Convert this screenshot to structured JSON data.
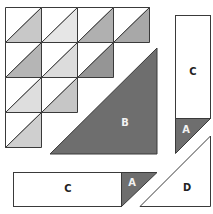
{
  "diagram": {
    "colors": {
      "outline": "#3a3a3a",
      "background": "#ffffff",
      "dark_piece": "#6e6e6e",
      "white_piece": "#ffffff"
    },
    "grid": {
      "rows": 4,
      "cols": 4,
      "shade_rows": [
        [
          "#c8c8c8",
          "#e6e6e6",
          "#b0b0b0",
          "#a8a8a8"
        ],
        [
          "#b5b5b5",
          "#dcdcdc",
          "#959595",
          null
        ],
        [
          "#dedede",
          "#c6c6c6",
          null,
          null
        ],
        [
          "#cfcfcf",
          null,
          null,
          null
        ]
      ]
    },
    "pieces": {
      "B": {
        "label": "B",
        "color": "#6e6e6e"
      },
      "C_vertical": {
        "label": "C"
      },
      "A_vertical": {
        "label": "A",
        "color": "#6e6e6e"
      },
      "C_horizontal": {
        "label": "C"
      },
      "A_horizontal": {
        "label": "A",
        "color": "#6e6e6e"
      },
      "D": {
        "label": "D"
      }
    }
  }
}
